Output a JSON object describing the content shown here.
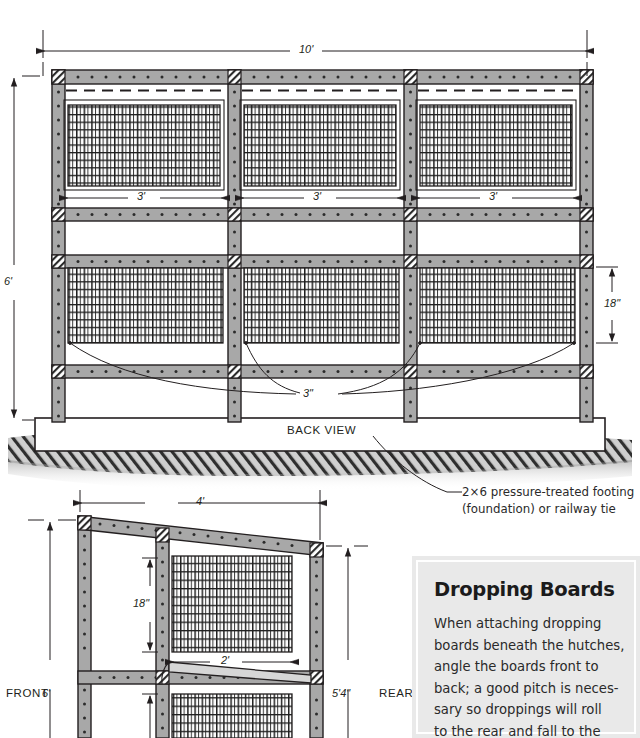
{
  "diagram": {
    "title_back": "BACK VIEW",
    "footing_note_line1": "2×6 pressure-treated footing",
    "footing_note_line2": "(foundation) or railway tie",
    "back_view": {
      "overall_width": "10'",
      "overall_height": "6'",
      "bay_width_1": "3'",
      "bay_width_2": "3'",
      "bay_width_3": "3'",
      "panel_height": "18\"",
      "gap_callout": "3\""
    },
    "side_view": {
      "front_label": "FRONT",
      "rear_label": "REAR",
      "depth": "4'",
      "front_height": "6'",
      "rear_height": "5'4\"",
      "panel_height": "18\"",
      "panel_width": "2'"
    }
  },
  "sidebar": {
    "heading": "Dropping Boards",
    "lines": [
      "When attaching dropping",
      "boards beneath the hutches,",
      "angle the boards front to",
      "back; a good pitch is neces-",
      "sary so droppings will roll",
      "to the rear and fall to the"
    ]
  },
  "colors": {
    "lumber_fill": "#a8a8a8",
    "ink": "#231f20",
    "ground": "#b9b9b9",
    "panel_bg": "#e9e9e9"
  }
}
